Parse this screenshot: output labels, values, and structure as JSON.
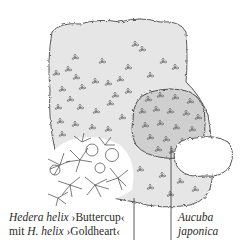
{
  "illustration": {
    "subject": "planting-scheme-sketch",
    "plants": [
      {
        "name": "large-hedge-shrub",
        "tone": "#e4e4e4"
      },
      {
        "name": "aucuba-japonica-shrub",
        "tone": "#c9c9c9"
      },
      {
        "name": "ivy-groundcover",
        "tone": "#ffffff"
      },
      {
        "name": "white-shrub",
        "tone": "#ffffff"
      }
    ],
    "colors": {
      "outline": "#555555",
      "text": "#2a2a2a",
      "background": "#ffffff"
    }
  },
  "labels": {
    "left": {
      "line1_italic": "Hedera helix",
      "line1_cultivar": " ›Buttercup‹",
      "line2_prefix": "mit ",
      "line2_italic": "H. helix",
      "line2_cultivar": " ›Goldheart‹"
    },
    "right": {
      "line1": "Aucuba",
      "line2": "japonica"
    }
  }
}
